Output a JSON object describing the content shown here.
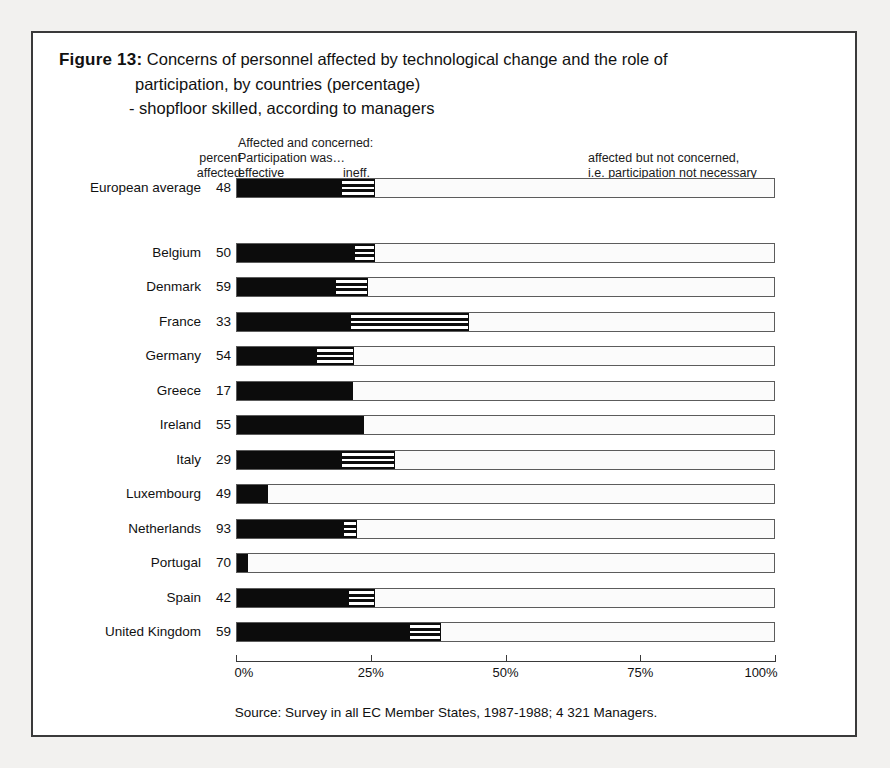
{
  "figure": {
    "label": "Figure 13:",
    "title_line_1": "Concerns of personnel affected by technological change and the role of",
    "title_line_2": "participation, by countries (percentage)",
    "title_line_3": "- shopfloor skilled, according to managers",
    "source": "Source: Survey in all EC Member States, 1987-1988; 4 321 Managers."
  },
  "legend": {
    "percent": "percent",
    "affected": "affected",
    "concerned_heading": "Affected and concerned:",
    "participation_was": "Participation was…",
    "effective": "effective",
    "ineffective": "ineff.",
    "not_concerned_line_1": "affected but not concerned,",
    "not_concerned_line_2": "i.e. participation not necessary"
  },
  "colors": {
    "effective": "#0c0c0c",
    "ineffective": "#ffffff",
    "not_concerned": "#fbfbfb",
    "frame": "#3a3a3a"
  },
  "chart_data": {
    "type": "bar",
    "subtype": "stacked-horizontal-100",
    "xlabel": "",
    "ylabel": "",
    "xlim": [
      0,
      100
    ],
    "xticks": [
      0,
      25,
      50,
      75,
      100
    ],
    "xticklabels": [
      "0%",
      "25%",
      "50%",
      "75%",
      "100%"
    ],
    "grid": false,
    "legend_position": "top",
    "series": [
      {
        "name": "Affected and concerned: participation was effective",
        "key": "effective"
      },
      {
        "name": "Affected and concerned: participation was ineffective",
        "key": "ineffective"
      },
      {
        "name": "Affected but not concerned, i.e. participation not necessary",
        "key": "not_concerned"
      }
    ],
    "categories": [
      "European average",
      "Belgium",
      "Denmark",
      "France",
      "Germany",
      "Greece",
      "Ireland",
      "Italy",
      "Luxembourg",
      "Netherlands",
      "Portugal",
      "Spain",
      "United Kingdom"
    ],
    "rows": [
      {
        "country": "European average",
        "percent_affected": "48",
        "effective": 19.3,
        "ineffective": 6.3,
        "not_concerned": 74.4,
        "separated": true
      },
      {
        "country": "Belgium",
        "percent_affected": "50",
        "effective": 21.7,
        "ineffective": 3.9,
        "not_concerned": 74.4
      },
      {
        "country": "Denmark",
        "percent_affected": "59",
        "effective": 18.2,
        "ineffective": 6.1,
        "not_concerned": 75.7
      },
      {
        "country": "France",
        "percent_affected": "33",
        "effective": 21.0,
        "ineffective": 22.1,
        "not_concerned": 56.9
      },
      {
        "country": "Germany",
        "percent_affected": "54",
        "effective": 14.7,
        "ineffective": 7.0,
        "not_concerned": 78.3
      },
      {
        "country": "Greece",
        "percent_affected": "17",
        "effective": 21.5,
        "ineffective": 0.0,
        "not_concerned": 78.5
      },
      {
        "country": "Ireland",
        "percent_affected": "55",
        "effective": 23.5,
        "ineffective": 0.0,
        "not_concerned": 76.5
      },
      {
        "country": "Italy",
        "percent_affected": "29",
        "effective": 19.3,
        "ineffective": 10.0,
        "not_concerned": 70.7
      },
      {
        "country": "Luxembourg",
        "percent_affected": "49",
        "effective": 5.7,
        "ineffective": 0.0,
        "not_concerned": 94.3
      },
      {
        "country": "Netherlands",
        "percent_affected": "93",
        "effective": 19.7,
        "ineffective": 2.6,
        "not_concerned": 77.7
      },
      {
        "country": "Portugal",
        "percent_affected": "70",
        "effective": 2.0,
        "ineffective": 0.0,
        "not_concerned": 98.0
      },
      {
        "country": "Spain",
        "percent_affected": "42",
        "effective": 20.6,
        "ineffective": 5.0,
        "not_concerned": 74.4
      },
      {
        "country": "United Kingdom",
        "percent_affected": "59",
        "effective": 32.0,
        "ineffective": 5.9,
        "not_concerned": 62.1
      }
    ]
  }
}
